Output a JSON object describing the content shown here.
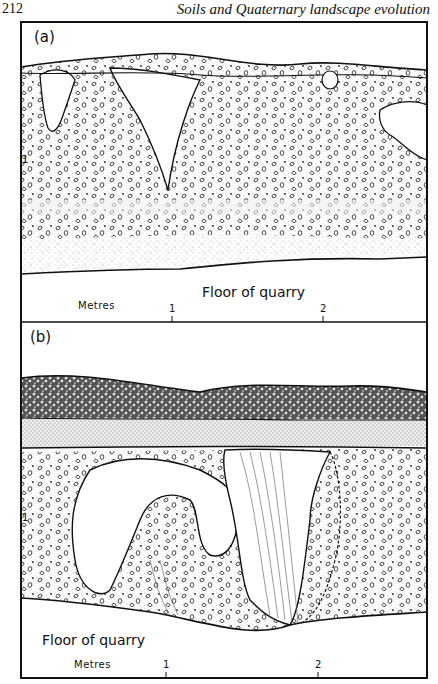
{
  "header": {
    "page_number": "212",
    "running_title": "Soils and Quaternary landscape evolution"
  },
  "figure": {
    "panels": [
      {
        "id": "a",
        "label": "(a)",
        "floor_label": "Floor of quarry",
        "scale": {
          "unit_label": "Metres",
          "ticks": [
            "1",
            "2"
          ]
        },
        "depth_marker": "1"
      },
      {
        "id": "b",
        "label": "(b)",
        "floor_label": "Floor of quarry",
        "scale": {
          "unit_label": "Metres",
          "ticks": [
            "1",
            "2"
          ]
        },
        "depth_markers": [
          "2",
          "1"
        ]
      }
    ]
  }
}
